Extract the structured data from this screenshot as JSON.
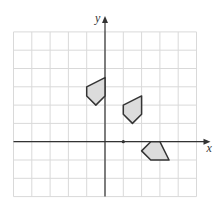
{
  "diagram": {
    "type": "coordinate-grid-transformations",
    "axes": {
      "x_label": "x",
      "y_label": "y",
      "x_range": [
        -5,
        5
      ],
      "y_range": [
        -3,
        6
      ]
    },
    "grid": {
      "origin_px": [
        105,
        141.7
      ],
      "unit_px": 18.3,
      "line_color": "#d9d9d9",
      "axis_color": "#333333"
    },
    "marked_point": {
      "x": 1,
      "y": 0
    },
    "shapes": [
      {
        "name": "shape-1",
        "fill": "#dcdcdc",
        "stroke": "#333333",
        "vertices": [
          [
            -1,
            3
          ],
          [
            0,
            3.5
          ],
          [
            0,
            2.5
          ],
          [
            -0.5,
            2
          ],
          [
            -1,
            2.5
          ]
        ]
      },
      {
        "name": "shape-2",
        "fill": "#dcdcdc",
        "stroke": "#333333",
        "vertices": [
          [
            1,
            2
          ],
          [
            2,
            2.5
          ],
          [
            2,
            1.5
          ],
          [
            1.5,
            1
          ],
          [
            1,
            1.5
          ]
        ]
      },
      {
        "name": "shape-3",
        "fill": "#dcdcdc",
        "stroke": "#333333",
        "vertices": [
          [
            2.5,
            0
          ],
          [
            3,
            0
          ],
          [
            3.5,
            -1
          ],
          [
            2.5,
            -1
          ],
          [
            2,
            -0.5
          ]
        ]
      }
    ]
  }
}
